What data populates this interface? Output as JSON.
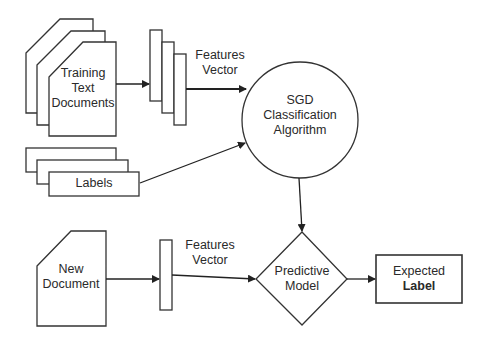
{
  "diagram": {
    "training_docs": {
      "label_lines": [
        "Training",
        "Text",
        "Documents"
      ]
    },
    "features_vector_top": {
      "label_lines": [
        "Features",
        "Vector"
      ]
    },
    "labels": {
      "label": "Labels"
    },
    "classifier": {
      "label_lines": [
        "SGD",
        "Classification",
        "Algorithm"
      ]
    },
    "new_document": {
      "label_lines": [
        "New",
        "Document"
      ]
    },
    "features_vector_bottom": {
      "label_lines": [
        "Features",
        "Vector"
      ]
    },
    "predictive_model": {
      "label_lines": [
        "Predictive",
        "Model"
      ]
    },
    "expected_label": {
      "label_lines": [
        "Expected",
        "Label"
      ]
    },
    "colors": {
      "stroke": "#2a2a2a",
      "background": "#ffffff"
    }
  }
}
